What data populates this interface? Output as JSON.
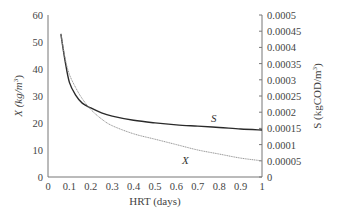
{
  "chart_data": {
    "type": "line",
    "title": "",
    "xlabel": "HRT (days)",
    "ylabel_left": "X (kg/m3)",
    "ylabel_right": "S (kgCOD/m3)",
    "xlim": [
      0,
      1
    ],
    "ylim_left": [
      0,
      60
    ],
    "ylim_right": [
      0,
      0.0005
    ],
    "grid": false,
    "legend": "inline labels",
    "x_ticks": [
      "0",
      "0.1",
      "0.2",
      "0.3",
      "0.4",
      "0.5",
      "0.6",
      "0.7",
      "0.8",
      "0.9",
      "1"
    ],
    "y_left_ticks": [
      "0",
      "10",
      "20",
      "30",
      "40",
      "50",
      "60"
    ],
    "y_right_ticks": [
      "0",
      "0.00005",
      "0.0001",
      "0.00015",
      "0.0002",
      "0.00025",
      "0.0003",
      "0.00035",
      "0.0004",
      "0.00045",
      "0.0005"
    ],
    "series": [
      {
        "name": "S",
        "axis": "right",
        "style": "solid-dark",
        "x": [
          0.06,
          0.08,
          0.1,
          0.13,
          0.16,
          0.2,
          0.25,
          0.3,
          0.4,
          0.5,
          0.6,
          0.7,
          0.8,
          0.9,
          1.0
        ],
        "values": [
          0.000442,
          0.000358,
          0.000292,
          0.000252,
          0.000228,
          0.000213,
          0.000198,
          0.000188,
          0.000175,
          0.000167,
          0.000161,
          0.000157,
          0.000153,
          0.000148,
          0.000145
        ]
      },
      {
        "name": "X",
        "axis": "left",
        "style": "thin-gray",
        "x": [
          0.06,
          0.08,
          0.1,
          0.13,
          0.16,
          0.2,
          0.25,
          0.3,
          0.4,
          0.5,
          0.6,
          0.7,
          0.8,
          0.9,
          1.0
        ],
        "values": [
          53,
          44,
          38,
          33,
          29,
          25,
          21.5,
          19,
          16,
          14,
          12,
          10,
          8.5,
          7,
          6
        ]
      }
    ],
    "annotations": [
      {
        "text": "S",
        "x": 0.73,
        "y_left": 21.5
      },
      {
        "text": "X",
        "x": 0.63,
        "y_left": 6.5
      }
    ]
  },
  "labels": {
    "y_left_title": "X (kg/m",
    "y_left_sup": "3",
    "y_left_close": ")",
    "y_right_title": "S (kgCOD/m",
    "y_right_sup": "3",
    "y_right_close": ")",
    "x_title": "HRT (days)",
    "s_label": "S",
    "x_label": "X"
  }
}
